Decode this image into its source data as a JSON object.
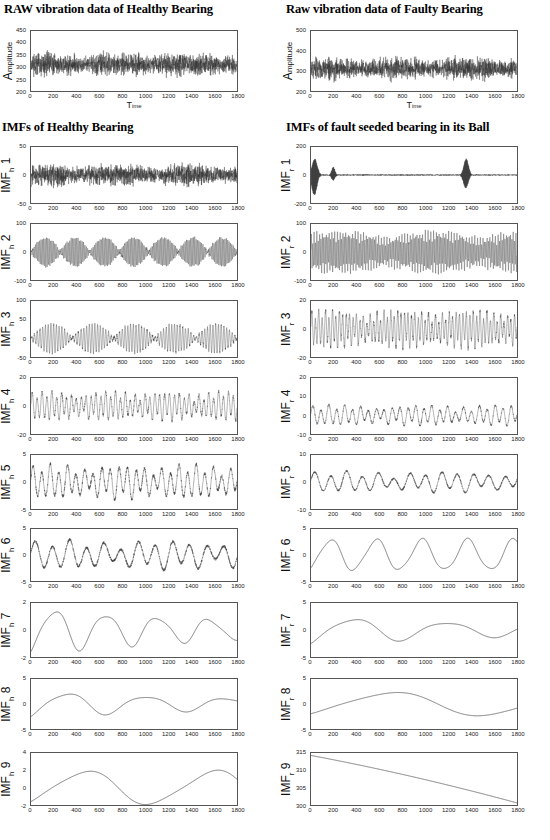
{
  "headings": {
    "raw_healthy": "RAW vibration data of Healthy Bearing",
    "raw_faulty": "Raw vibration data of Faulty Bearing",
    "imf_healthy": "IMFs of Healthy Bearing",
    "imf_faulty": "IMFs of fault seeded bearing in its Ball"
  },
  "axis_labels": {
    "time": "T",
    "time_small": "ime",
    "amplitude": "A",
    "amplitude_small": "mplitude"
  },
  "xticks": [
    0,
    200,
    400,
    600,
    800,
    1000,
    1200,
    1400,
    1600,
    1800
  ],
  "chart_data": [
    {
      "id": "raw-healthy",
      "type": "line",
      "title": "RAW vibration data of Healthy Bearing",
      "xlabel": "Time",
      "ylabel": "Amplitude",
      "xlim": [
        0,
        1800
      ],
      "ylim": [
        200,
        450
      ],
      "yticks": [
        200,
        250,
        300,
        350,
        400,
        450
      ],
      "signal": {
        "kind": "noise",
        "mean": 310,
        "amplitude": 45,
        "seed": 11,
        "samples": 1800,
        "description": "dense broadband random vibration about 310 with peaks near 410 and troughs near 220"
      }
    },
    {
      "id": "raw-faulty",
      "type": "line",
      "title": "Raw vibration data of Faulty Bearing",
      "xlabel": "Time",
      "ylabel": "Amplitude",
      "xlim": [
        0,
        1800
      ],
      "ylim": [
        200,
        500
      ],
      "yticks": [
        200,
        300,
        400,
        500
      ],
      "signal": {
        "kind": "noise",
        "mean": 312,
        "amplitude": 52,
        "seed": 23,
        "samples": 1800,
        "description": "dense broadband random vibration about 312, larger early excursions toward 420"
      }
    },
    {
      "id": "imf-h-1",
      "type": "line",
      "title": "IMF h 1",
      "ylabel": "IMF",
      "ysub": "h",
      "index": 1,
      "xlim": [
        0,
        1800
      ],
      "ylim": [
        -50,
        50
      ],
      "yticks": [
        -50,
        0,
        50
      ],
      "signal": {
        "kind": "noise",
        "mean": 0,
        "amplitude": 17,
        "seed": 31,
        "samples": 1800,
        "description": "high frequency noise band roughly +/-20 with occasional spikes to 35"
      }
    },
    {
      "id": "imf-r-1",
      "type": "line",
      "title": "IMF r 1",
      "ylabel": "IMF",
      "ysub": "r",
      "index": 1,
      "xlim": [
        0,
        1800
      ],
      "ylim": [
        -200,
        200
      ],
      "yticks": [
        -200,
        0,
        200
      ],
      "signal": {
        "kind": "impulse-noise",
        "mean": 0,
        "amplitude": 10,
        "seed": 41,
        "samples": 1800,
        "bursts": [
          {
            "center": 30,
            "height": 150,
            "width": 22
          },
          {
            "center": 195,
            "height": 55,
            "width": 14
          },
          {
            "center": 1355,
            "height": 120,
            "width": 20
          }
        ],
        "description": "low level noise with three large transient bursts near t=30, 195 and 1355"
      }
    },
    {
      "id": "imf-h-2",
      "type": "line",
      "title": "IMF h 2",
      "ylabel": "IMF",
      "ysub": "h",
      "index": 2,
      "xlim": [
        0,
        1800
      ],
      "ylim": [
        -100,
        100
      ],
      "yticks": [
        -100,
        0,
        100
      ],
      "signal": {
        "kind": "beating",
        "mean": 0,
        "amplitude": 55,
        "carrier": 150,
        "beat": 7,
        "seed": 52,
        "samples": 1800,
        "description": "amplitude modulated bursts alternating between +/-60 and near-zero nodes"
      }
    },
    {
      "id": "imf-r-2",
      "type": "line",
      "title": "IMF r 2",
      "ylabel": "IMF",
      "ysub": "r",
      "index": 2,
      "xlim": [
        0,
        1800
      ],
      "ylim": [
        -100,
        100
      ],
      "yticks": [
        -100,
        0,
        100
      ],
      "signal": {
        "kind": "dense-osc",
        "mean": 0,
        "amplitude": 58,
        "carrier": 150,
        "beat": 2.2,
        "seed": 61,
        "samples": 1800,
        "description": "continuous dense oscillation filling +/-60, slight decay in the middle"
      }
    },
    {
      "id": "imf-h-3",
      "type": "line",
      "title": "IMF h 3",
      "ylabel": "IMF",
      "ysub": "h",
      "index": 3,
      "xlim": [
        0,
        1800
      ],
      "ylim": [
        -50,
        100
      ],
      "yticks": [
        -50,
        0,
        50,
        100
      ],
      "signal": {
        "kind": "beating",
        "mean": 0,
        "amplitude": 42,
        "carrier": 75,
        "beat": 5,
        "seed": 73,
        "samples": 1800,
        "description": "intermittent bursts reaching +/-45 separated by quiet low amplitude stretches"
      }
    },
    {
      "id": "imf-r-3",
      "type": "line",
      "title": "IMF r 3",
      "ylabel": "IMF",
      "ysub": "r",
      "index": 3,
      "xlim": [
        0,
        1800
      ],
      "ylim": [
        -20,
        20
      ],
      "yticks": [
        -20,
        0,
        20
      ],
      "signal": {
        "kind": "dense-osc",
        "mean": 0,
        "amplitude": 11,
        "carrier": 60,
        "beat": 3,
        "seed": 83,
        "samples": 1800,
        "description": "steady oscillation about +/-10 tapering toward the right edge"
      }
    },
    {
      "id": "imf-h-4",
      "type": "line",
      "title": "IMF h 4",
      "ylabel": "IMF",
      "ysub": "h",
      "index": 4,
      "xlim": [
        0,
        1800
      ],
      "ylim": [
        -20,
        20
      ],
      "yticks": [
        -20,
        0,
        20
      ],
      "signal": {
        "kind": "dense-osc",
        "mean": 0,
        "amplitude": 8.5,
        "carrier": 42,
        "beat": 3.5,
        "seed": 91,
        "samples": 1800,
        "description": "oscillation +/-9 with a calm region around t=700-950"
      }
    },
    {
      "id": "imf-r-4",
      "type": "line",
      "title": "IMF r 4",
      "ylabel": "IMF",
      "ysub": "r",
      "index": 4,
      "xlim": [
        0,
        1800
      ],
      "ylim": [
        -10,
        20
      ],
      "yticks": [
        -10,
        0,
        10,
        20
      ],
      "signal": {
        "kind": "dense-osc",
        "mean": 0,
        "amplitude": 4.5,
        "carrier": 26,
        "beat": 2.5,
        "seed": 101,
        "samples": 1800,
        "description": "moderate oscillation about zero, initial dip to -9 near t=40"
      }
    },
    {
      "id": "imf-h-5",
      "type": "line",
      "title": "IMF h 5",
      "ylabel": "IMF",
      "ysub": "h",
      "index": 5,
      "xlim": [
        0,
        1800
      ],
      "ylim": [
        -5,
        5
      ],
      "yticks": [
        -5,
        0,
        5
      ],
      "signal": {
        "kind": "dense-osc",
        "mean": 0,
        "amplitude": 2.6,
        "carrier": 24,
        "beat": 3,
        "seed": 113,
        "samples": 1800,
        "description": "irregular oscillation filling +/-3 with peaks touching 4"
      }
    },
    {
      "id": "imf-r-5",
      "type": "line",
      "title": "IMF r 5",
      "ylabel": "IMF",
      "ysub": "r",
      "index": 5,
      "xlim": [
        0,
        1800
      ],
      "ylim": [
        -10,
        10
      ],
      "yticks": [
        -10,
        0,
        10
      ],
      "signal": {
        "kind": "dense-osc",
        "mean": 0,
        "amplitude": 3.2,
        "carrier": 13,
        "beat": 2,
        "seed": 123,
        "samples": 1800,
        "description": "smooth oscillation decaying from +/-5 toward +/-2 across the record"
      }
    },
    {
      "id": "imf-h-6",
      "type": "line",
      "title": "IMF h 6",
      "ylabel": "IMF",
      "ysub": "h",
      "index": 6,
      "xlim": [
        0,
        1800
      ],
      "ylim": [
        -5,
        5
      ],
      "yticks": [
        -5,
        0,
        5
      ],
      "signal": {
        "kind": "dense-osc",
        "mean": 0,
        "amplitude": 2.3,
        "carrier": 12,
        "beat": 2,
        "seed": 131,
        "samples": 1800,
        "description": "smooth wave +/-3 with sharper excursions near t=500 and t=1250"
      }
    },
    {
      "id": "imf-r-6",
      "type": "line",
      "title": "IMF r 6",
      "ylabel": "IMF",
      "ysub": "r",
      "index": 6,
      "xlim": [
        0,
        1800
      ],
      "ylim": [
        -5,
        5
      ],
      "yticks": [
        -5,
        0,
        5
      ],
      "signal": {
        "kind": "smooth",
        "mean": 0,
        "amplitude": 2.9,
        "cycles": 4.5,
        "seed": 141,
        "samples": 1800,
        "description": "regular smooth sinusoid of about 4.5 cycles between -3 and +3"
      }
    },
    {
      "id": "imf-h-7",
      "type": "line",
      "title": "IMF h 7",
      "ylabel": "IMF",
      "ysub": "h",
      "index": 7,
      "xlim": [
        0,
        1800
      ],
      "ylim": [
        -2,
        2
      ],
      "yticks": [
        -2,
        0,
        2
      ],
      "signal": {
        "kind": "smooth-decay",
        "mean": 0,
        "amplitude": 1.4,
        "cycles": 4,
        "seed": 151,
        "samples": 1800,
        "description": "smooth wave peaking 1.5 near t=750 and -1.6 near t=900, flattening after t=1400"
      }
    },
    {
      "id": "imf-r-7",
      "type": "line",
      "title": "IMF r 7",
      "ylabel": "IMF",
      "ysub": "r",
      "index": 7,
      "xlim": [
        0,
        1800
      ],
      "ylim": [
        -5,
        5
      ],
      "yticks": [
        -5,
        0,
        5
      ],
      "signal": {
        "kind": "smooth-decay",
        "mean": 0,
        "amplitude": 2.2,
        "cycles": 2.2,
        "seed": 161,
        "samples": 1800,
        "description": "slow wave starting at +2.5, trough -2.4 near t=430, small ripples afterwards"
      }
    },
    {
      "id": "imf-h-8",
      "type": "line",
      "title": "IMF h 8",
      "ylabel": "IMF",
      "ysub": "h",
      "index": 8,
      "xlim": [
        0,
        1800
      ],
      "ylim": [
        -5,
        5
      ],
      "yticks": [
        -5,
        0,
        5
      ],
      "signal": {
        "kind": "smooth-decay",
        "mean": 0,
        "amplitude": 2.2,
        "cycles": 2.6,
        "seed": 171,
        "samples": 1800,
        "description": "flat near -1.7 until t=300 then hump to +2 at t=600, decaying ripples after"
      }
    },
    {
      "id": "imf-r-8",
      "type": "line",
      "title": "IMF r 8",
      "ylabel": "IMF",
      "ysub": "r",
      "index": 8,
      "xlim": [
        0,
        1800
      ],
      "ylim": [
        -5,
        5
      ],
      "yticks": [
        -5,
        0,
        5
      ],
      "signal": {
        "kind": "smooth",
        "mean": 0,
        "amplitude": 2.3,
        "cycles": 1.1,
        "seed": 181,
        "samples": 1800,
        "description": "single slow cycle from +2.4 down to -2.2 at t=640 and back to +1 at t=1300"
      }
    },
    {
      "id": "imf-h-9",
      "type": "line",
      "title": "IMF h 9",
      "ylabel": "IMF",
      "ysub": "h",
      "index": 9,
      "xlim": [
        0,
        1800
      ],
      "ylim": [
        -2,
        4
      ],
      "yticks": [
        -2,
        0,
        2,
        4
      ],
      "signal": {
        "kind": "smooth",
        "mean": 0,
        "amplitude": 1.9,
        "cycles": 1.6,
        "seed": 191,
        "samples": 1800,
        "description": "smooth wave from -1.5 rising to +1.6 at t=600, -2 at t=1180, +1.9 at t=1680"
      }
    },
    {
      "id": "imf-r-9",
      "type": "line",
      "title": "IMF r 9",
      "ylabel": "IMF",
      "ysub": "r",
      "index": 9,
      "xlim": [
        0,
        1800
      ],
      "ylim": [
        300,
        315
      ],
      "yticks": [
        300,
        305,
        310,
        315
      ],
      "signal": {
        "kind": "trend",
        "start": 314.3,
        "end": 300.6,
        "seed": 201,
        "samples": 1800,
        "description": "monotonic residual trend falling from about 314 to about 300.5"
      }
    }
  ]
}
